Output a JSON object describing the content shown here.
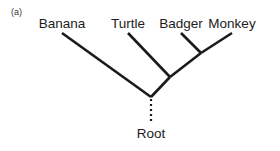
{
  "panel": {
    "label": "(a)"
  },
  "colors": {
    "background": "#ffffff",
    "branch": "#1a1a1a",
    "text": "#1c1c1c",
    "panel_text": "#3a3a3a"
  },
  "tree": {
    "root_label": "Root",
    "taxa": [
      {
        "name": "Banana",
        "tip_x": 62,
        "tip_y": 33,
        "label_x": 62
      },
      {
        "name": "Turtle",
        "tip_x": 128,
        "tip_y": 33,
        "label_x": 128
      },
      {
        "name": "Badger",
        "tip_x": 181,
        "tip_y": 33,
        "label_x": 181
      },
      {
        "name": "Monkey",
        "tip_x": 232,
        "tip_y": 33,
        "label_x": 232
      }
    ],
    "nodes": [
      {
        "id": "root",
        "x": 151,
        "y": 97
      },
      {
        "id": "turtle-clade",
        "x": 170,
        "y": 77
      },
      {
        "id": "badger-monkey-clade",
        "x": 201,
        "y": 53
      }
    ],
    "branches": [
      {
        "from": "Banana",
        "x1": 62,
        "y1": 33,
        "x2": 151,
        "y2": 97
      },
      {
        "from": "Turtle",
        "x1": 128,
        "y1": 33,
        "x2": 170,
        "y2": 77
      },
      {
        "from": "Badger",
        "x1": 181,
        "y1": 33,
        "x2": 201,
        "y2": 53
      },
      {
        "from": "Monkey",
        "x1": 232,
        "y1": 33,
        "x2": 201,
        "y2": 53
      },
      {
        "from": "badger-monkey-clade",
        "x1": 201,
        "y1": 53,
        "x2": 170,
        "y2": 77
      },
      {
        "from": "turtle-clade",
        "x1": 170,
        "y1": 77,
        "x2": 151,
        "y2": 97
      }
    ],
    "root_stem": {
      "x": 151,
      "y1": 99,
      "y2": 124,
      "style": "dotted"
    },
    "branch_width": 2.6,
    "stem_width": 2.2
  }
}
